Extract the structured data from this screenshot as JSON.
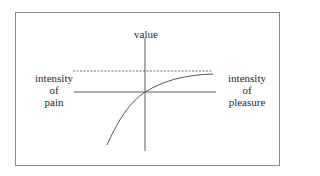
{
  "diagram": {
    "y_axis_label": "value",
    "left_label": [
      "intensity",
      "of",
      "pain"
    ],
    "right_label": [
      "intensity",
      "of",
      "pleasure"
    ],
    "elements": {
      "frame": "rectangular border",
      "vertical_axis": "value axis",
      "horizontal_axis": "intensity axis (pain left, pleasure right)",
      "dashed_line": "upper asymptote of value",
      "curve": "concave value curve through origin, steep decline for pain, saturating for pleasure"
    },
    "colors": {
      "line": "#5a5a5a",
      "frame": "#8a8a8a",
      "text": "#2a2a2a"
    }
  }
}
